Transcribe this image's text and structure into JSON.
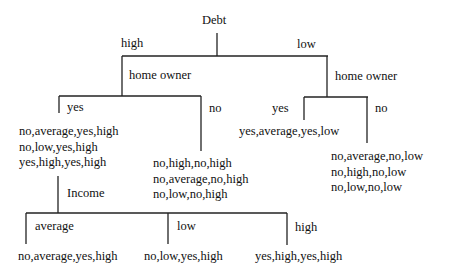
{
  "root": {
    "attribute": "Debt"
  },
  "branches": {
    "high": {
      "label": "high",
      "attribute": "home owner",
      "yes": {
        "label": "yes",
        "records": [
          "no,average,yes,high",
          "no,low,yes,high",
          "yes,high,yes,high"
        ],
        "attribute": "Income",
        "average": {
          "label": "average",
          "records": [
            "no,average,yes,high"
          ]
        },
        "low": {
          "label": "low",
          "records": [
            "no,low,yes,high"
          ]
        },
        "high": {
          "label": "high",
          "records": [
            "yes,high,yes,high"
          ]
        }
      },
      "no": {
        "label": "no",
        "records": [
          "no,high,no,high",
          "no,average,no,high",
          "no,low,no,high"
        ]
      }
    },
    "low": {
      "label": "low",
      "attribute": "home owner",
      "yes": {
        "label": "yes",
        "records": [
          "yes,average,yes,low"
        ]
      },
      "no": {
        "label": "no",
        "records": [
          "no,average,no,low",
          "no,high,no,low",
          "no,low,no,low"
        ]
      }
    }
  }
}
